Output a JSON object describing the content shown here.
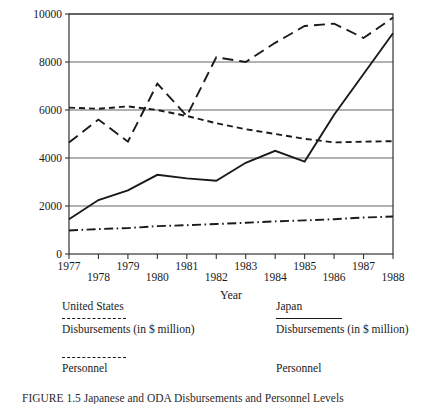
{
  "figure": {
    "caption": "FIGURE 1.5  Japanese and ODA Disbursements and Personnel Levels"
  },
  "chart_data": {
    "type": "line",
    "title": "",
    "xlabel": "Year",
    "ylabel": "",
    "xlim": [
      1977,
      1988
    ],
    "ylim": [
      0,
      10000
    ],
    "yticks": [
      0,
      2000,
      4000,
      6000,
      8000,
      10000
    ],
    "ytick_labels": [
      "0",
      "2000",
      "4000",
      "6000",
      "8000",
      "10000"
    ],
    "xticks": [
      1977,
      1978,
      1979,
      1980,
      1981,
      1982,
      1983,
      1984,
      1985,
      1986,
      1987,
      1988
    ],
    "xtick_labels": [
      "1977",
      "1978",
      "1979",
      "1980",
      "1981",
      "1982",
      "1983",
      "1984",
      "1985",
      "1986",
      "1987",
      "1988"
    ],
    "grid": "horizontal",
    "legend_position": "below",
    "x": [
      1977,
      1978,
      1979,
      1980,
      1981,
      1982,
      1983,
      1984,
      1985,
      1986,
      1987,
      1988
    ],
    "series": [
      {
        "name": "Japan Disbursements (in $ million)",
        "style": "long-dash",
        "color": "#1a1a1a",
        "values": [
          4650,
          5600,
          4680,
          7100,
          5750,
          8200,
          8000,
          8800,
          9500,
          9600,
          9000,
          9850
        ]
      },
      {
        "name": "United States Disbursements (in $ million)",
        "style": "short-dash",
        "color": "#1a1a1a",
        "values": [
          6100,
          6050,
          6150,
          6000,
          5750,
          5450,
          5200,
          5000,
          4800,
          4650,
          4680,
          4700
        ]
      },
      {
        "name": "Japan Personnel",
        "style": "solid",
        "color": "#1a1a1a",
        "values": [
          1450,
          2250,
          2650,
          3300,
          3150,
          3050,
          3800,
          4300,
          3850,
          5800,
          7500,
          9200
        ]
      },
      {
        "name": "United States Personnel",
        "style": "dash-dot",
        "color": "#1a1a1a",
        "values": [
          980,
          1040,
          1080,
          1160,
          1200,
          1250,
          1300,
          1360,
          1400,
          1450,
          1520,
          1560
        ]
      }
    ]
  },
  "legend": {
    "columns": [
      {
        "country": "United States",
        "entries": [
          {
            "sample": "short-dash",
            "label": "Disbursements (in $ million)"
          },
          {
            "sample": "dash-dot",
            "label": "Personnel"
          }
        ]
      },
      {
        "country": "Japan",
        "entries": [
          {
            "sample": "solid",
            "label": "Disbursements (in $ million)"
          },
          {
            "sample": "none",
            "label": "Personnel"
          }
        ]
      }
    ]
  }
}
